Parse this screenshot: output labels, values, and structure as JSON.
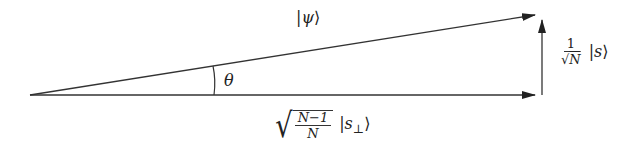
{
  "diagram": {
    "type": "vector-decomposition",
    "colors": {
      "line": "#333333",
      "background": "#ffffff"
    },
    "vectors": [
      {
        "name": "psi",
        "from": [
          30,
          95
        ],
        "to": [
          535,
          15
        ]
      },
      {
        "name": "s_perp",
        "from": [
          30,
          95
        ],
        "to": [
          535,
          95
        ]
      },
      {
        "name": "s",
        "from": [
          542,
          95
        ],
        "to": [
          542,
          20
        ]
      }
    ],
    "labels": {
      "psi": {
        "ket_open": "|",
        "symbol": "ψ",
        "ket_close": "⟩"
      },
      "theta": "θ",
      "s_component": {
        "numerator": "1",
        "denominator_radical": "√",
        "denominator_var": "N",
        "ket_open": "|",
        "symbol": "s",
        "ket_close": "⟩"
      },
      "s_perp_component": {
        "radical": "√",
        "numerator": "N−1",
        "denominator": "N",
        "ket_open": "|",
        "symbol": "s",
        "subscript": "⊥",
        "ket_close": "⟩"
      }
    }
  }
}
